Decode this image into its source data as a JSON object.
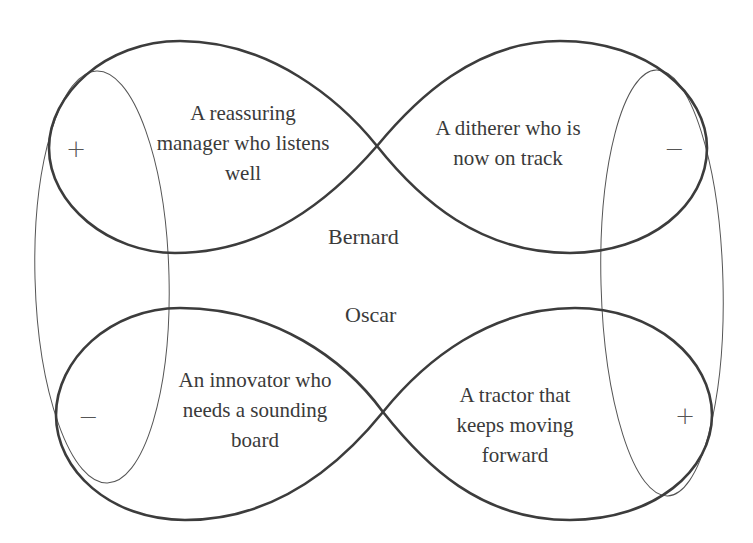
{
  "diagram": {
    "type": "infinity-loop-quadrant-diagram",
    "people": {
      "upper": "Bernard",
      "lower": "Oscar"
    },
    "quadrants": {
      "upper_left": {
        "label": "A reassuring\nmanager who listens\nwell",
        "sign": "+"
      },
      "upper_right": {
        "label": "A ditherer who is\nnow on track",
        "sign": "−"
      },
      "lower_left": {
        "label": "An innovator who\nneeds a sounding\nboard",
        "sign": "−"
      },
      "lower_right": {
        "label": "A tractor that\nkeeps moving\nforward",
        "sign": "+"
      }
    },
    "colors": {
      "loop_stroke": "#3c3c3c",
      "ellipse_stroke": "#555555",
      "text": "#3a3a3a",
      "background": "#ffffff"
    }
  }
}
